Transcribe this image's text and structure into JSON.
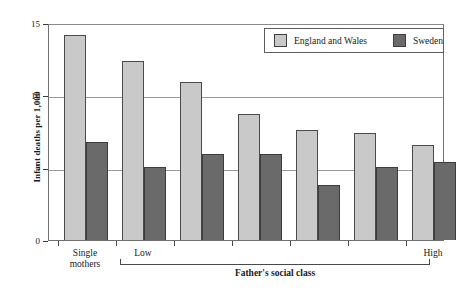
{
  "chart_data": {
    "type": "bar",
    "title": "",
    "xlabel": "Father's social class",
    "ylabel": "Infant deaths per 1,000",
    "ylim": [
      0,
      15
    ],
    "yticks": [
      0,
      5,
      10,
      15
    ],
    "ytick_labels": [
      "0",
      "5",
      "10",
      "15"
    ],
    "grid": true,
    "grid_axis": "y",
    "legend_position": "top-right",
    "categories": [
      "Single mothers",
      "Low",
      "",
      "",
      "",
      "",
      "High"
    ],
    "category_axis_labels": [
      {
        "index": 0,
        "label_line1": "Single",
        "label_line2": "mothers"
      },
      {
        "index": 1,
        "label_line1": "Low",
        "label_line2": ""
      },
      {
        "index": 6,
        "label_line1": "High",
        "label_line2": ""
      }
    ],
    "series": [
      {
        "name": "England and Wales",
        "color": "#c9c9c9",
        "values": [
          14.2,
          12.35,
          10.9,
          8.7,
          7.6,
          7.4,
          6.55
        ]
      },
      {
        "name": "Sweden",
        "color": "#6a6a6a",
        "values": [
          6.8,
          5.05,
          5.95,
          5.95,
          3.8,
          5.05,
          5.4
        ]
      }
    ]
  },
  "legend": {
    "entries": [
      {
        "label": "England and Wales",
        "color": "#c9c9c9"
      },
      {
        "label": "Sweden",
        "color": "#6a6a6a"
      }
    ]
  },
  "axes": {
    "y_title": "Infant deaths per 1,000",
    "x_bracket_label": "Father's social class"
  },
  "colors": {
    "england_wales": "#c9c9c9",
    "sweden": "#6a6a6a",
    "frame": "#6f6f6f",
    "gridline": "#9a9a9a",
    "background": "#ffffff"
  }
}
